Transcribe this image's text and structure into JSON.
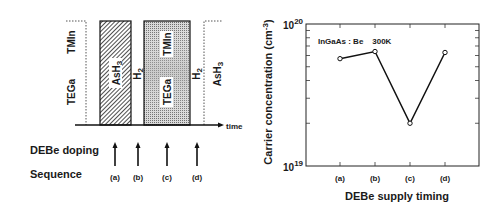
{
  "diagram": {
    "gas_labels_left": {
      "top": "TMIn",
      "bottom": "TEGa"
    },
    "block1": {
      "label": "AsH",
      "subscript": "3"
    },
    "gap1": {
      "label": "H",
      "subscript": "2"
    },
    "block2": {
      "top_label": "TMIn",
      "bottom_label": "TEGa"
    },
    "gap2": {
      "label": "H",
      "subscript": "2"
    },
    "block3": {
      "label": "AsH",
      "subscript": "3"
    },
    "time_axis_label": "time",
    "row_labels": {
      "doping": "DEBe doping",
      "sequence": "Sequence"
    },
    "sequence": [
      "(a)",
      "(b)",
      "(c)",
      "(d)"
    ]
  },
  "chart_data": {
    "type": "line",
    "title": "",
    "annotation": "InGaAs : Be    300K",
    "xlabel": "DEBe supply timing",
    "ylabel": "Carrier concentration (cm",
    "ylabel_sup": "-3",
    "ylabel_close": ")",
    "yscale": "log",
    "ylim": [
      1e+19,
      1e+20
    ],
    "y_tick_labels": [
      {
        "base": "10",
        "exp": "19"
      },
      {
        "base": "10",
        "exp": "20"
      }
    ],
    "categories": [
      "(a)",
      "(b)",
      "(c)",
      "(d)"
    ],
    "series": [
      {
        "name": "InGaAs:Be 300K",
        "values": [
          5.7e+19,
          6.4e+19,
          2e+19,
          6.3e+19
        ],
        "marker": "open-circle"
      }
    ],
    "grid": false,
    "legend": "none"
  }
}
